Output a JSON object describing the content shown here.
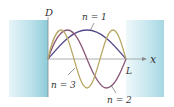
{
  "diagram": {
    "axis_y_label": "D",
    "axis_x_label": "x",
    "length_label": "L",
    "curves": [
      {
        "n": 1,
        "label": "n = 1",
        "color": "#56498a"
      },
      {
        "n": 2,
        "label": "n = 2",
        "color": "#8a5878"
      },
      {
        "n": 3,
        "label": "n = 3",
        "color": "#b9a866"
      }
    ],
    "colors": {
      "wall_dark": "#7fc6d6",
      "wall_light": "#eaf6f9",
      "axis": "#888888"
    }
  }
}
